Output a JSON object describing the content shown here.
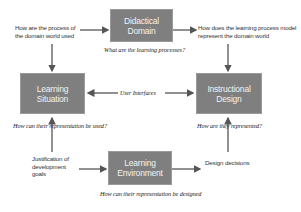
{
  "boxes": {
    "didactical_domain": "Didactical Domain",
    "learning_situation": "Learning Situation",
    "instructional_design": "Instructional Design",
    "learning_environment": "Learning Environment"
  },
  "labels": {
    "top_left": "How are the process of the domain world used",
    "top_right": "How does the learning process model represent the domain world",
    "user_interfaces": "User Interfaces",
    "justification": "Justification of development goals",
    "design_decisions": "Design decisions"
  },
  "questions": {
    "didactical": "What are the learning processes?",
    "situation": "How can their representation be used?",
    "instructional": "How are they represented?",
    "environment": "How can their representation be designed"
  },
  "colors": {
    "box_fill": "#7f7f7f",
    "box_text": "#f2f2f2",
    "arrow": "#555555"
  }
}
